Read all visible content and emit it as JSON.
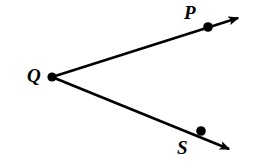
{
  "figure": {
    "type": "geometry-diagram",
    "background_color": "#ffffff",
    "stroke_color": "#000000",
    "width": 256,
    "height": 168
  },
  "labels": {
    "vertex": "Q",
    "upper_point": "P",
    "lower_point": "S"
  },
  "geometry": {
    "vertex": {
      "name": "Q",
      "x": 52,
      "y": 77,
      "dot_radius": 4.6
    },
    "points": [
      {
        "name": "P",
        "x": 208,
        "y": 27,
        "dot_radius": 4.8
      },
      {
        "name": "S",
        "x": 201,
        "y": 131,
        "dot_radius": 4.8
      }
    ],
    "rays": [
      {
        "name": "ray-QP",
        "from": "Q",
        "through": "P",
        "x1": 52,
        "y1": 77,
        "x2": 245,
        "y2": 16,
        "stroke_width": 2.6,
        "arrowhead": true
      },
      {
        "name": "ray-QS",
        "from": "Q",
        "through": "S",
        "x1": 52,
        "y1": 77,
        "x2": 236,
        "y2": 152,
        "stroke_width": 2.6,
        "arrowhead": true
      }
    ]
  }
}
